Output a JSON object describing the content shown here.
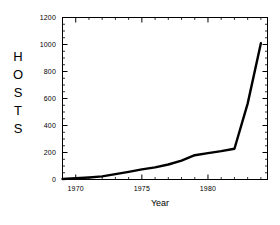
{
  "chart_data": {
    "type": "line",
    "title": "",
    "xlabel": "Year",
    "ylabel": "HOSTS",
    "ylabel_chars": [
      "H",
      "O",
      "S",
      "T",
      "S"
    ],
    "xlim": [
      1969,
      1984.5
    ],
    "ylim": [
      0,
      1200
    ],
    "grid": false,
    "legend": null,
    "line_color": "#000000",
    "x_major_ticks": [
      1970,
      1975,
      1980
    ],
    "x_major_tick_labels": [
      "1970",
      "1975",
      "1980"
    ],
    "x_minor_tick_interval": 1,
    "y_major_ticks": [
      0,
      200,
      400,
      600,
      800,
      1000,
      1200
    ],
    "y_major_tick_labels": [
      "0",
      "200",
      "400",
      "600",
      "800",
      "1000",
      "1200"
    ],
    "y_minor_tick_interval": 50,
    "x": [
      1969,
      1970,
      1971,
      1972,
      1973,
      1974,
      1975,
      1976,
      1977,
      1978,
      1979,
      1980,
      1981,
      1982,
      1983,
      1984
    ],
    "values": [
      4,
      9,
      15,
      23,
      40,
      57,
      75,
      90,
      111,
      140,
      180,
      195,
      210,
      228,
      562,
      1010
    ],
    "series": [
      {
        "name": "Hosts",
        "values": [
          4,
          9,
          15,
          23,
          40,
          57,
          75,
          90,
          111,
          140,
          180,
          195,
          210,
          228,
          562,
          1010
        ]
      }
    ],
    "annotations": []
  },
  "axes": {
    "frame_color": "#000000",
    "background": "#ffffff"
  }
}
